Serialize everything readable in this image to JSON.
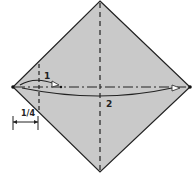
{
  "diagram": {
    "type": "origami-fold-diagram",
    "shape": "square rotated 45deg (diamond)",
    "paper_color": "#c9c9c9",
    "line_color": "#222222",
    "steps": [
      {
        "label": "1",
        "description": "fold left corner to the 1/4 crease point"
      },
      {
        "label": "2",
        "description": "fold left corner across to the right corner"
      }
    ],
    "measure": {
      "label": "1/4"
    }
  }
}
